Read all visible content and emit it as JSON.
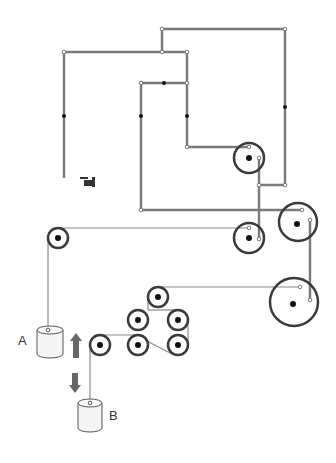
{
  "diagram": {
    "labels": {
      "bucket_a": "A",
      "bucket_b": "B"
    },
    "colors": {
      "rail": "#7a7a7a",
      "rope": "#8a8a8a",
      "pulley_ring": "#3a3a3a",
      "arrow": "#666666",
      "bucket_fill": "#f4f4f4",
      "bucket_stroke": "#555555"
    },
    "icons": {
      "pointing_hand": "pointing-hand-icon",
      "up_arrow": "up-arrow-icon",
      "down_arrow": "down-arrow-icon"
    }
  }
}
